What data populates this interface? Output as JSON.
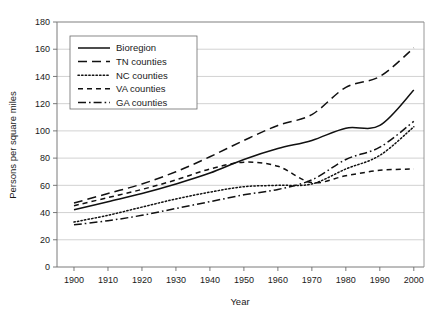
{
  "chart_data": {
    "type": "line",
    "title": "",
    "xlabel": "Year",
    "ylabel": "Persons per square miles",
    "xlim": [
      1895,
      2003
    ],
    "ylim": [
      0,
      180
    ],
    "xticks": [
      1900,
      1910,
      1920,
      1930,
      1940,
      1950,
      1960,
      1970,
      1980,
      1990,
      2000
    ],
    "yticks": [
      0,
      20,
      40,
      60,
      80,
      100,
      120,
      140,
      160,
      180
    ],
    "grid": "horizontal",
    "legend_position": "top-left-inside",
    "x": [
      1900,
      1910,
      1920,
      1930,
      1940,
      1950,
      1960,
      1970,
      1980,
      1990,
      2000
    ],
    "series": [
      {
        "name": "Bioregion",
        "style": "solid",
        "values": [
          42,
          48,
          54,
          61,
          69,
          79,
          87,
          93,
          102,
          104,
          130
        ]
      },
      {
        "name": "TN counties",
        "style": "long-dash",
        "values": [
          47,
          54,
          61,
          70,
          81,
          93,
          104,
          112,
          132,
          140,
          161
        ]
      },
      {
        "name": "NC counties",
        "style": "dotted",
        "values": [
          33,
          38,
          44,
          50,
          55,
          59,
          60,
          61,
          72,
          82,
          103
        ]
      },
      {
        "name": "VA counties",
        "style": "dashed",
        "values": [
          45,
          51,
          57,
          64,
          72,
          77,
          74,
          62,
          67,
          71,
          72
        ]
      },
      {
        "name": "GA counties",
        "style": "dash-dot",
        "values": [
          31,
          34,
          38,
          43,
          48,
          53,
          57,
          64,
          79,
          88,
          107
        ]
      }
    ]
  },
  "axes": {
    "y_title": "Persons per square miles",
    "x_title": "Year",
    "y_tick_labels": [
      "0",
      "20",
      "40",
      "60",
      "80",
      "100",
      "120",
      "140",
      "160",
      "180"
    ],
    "x_tick_labels": [
      "1900",
      "1910",
      "1920",
      "1930",
      "1940",
      "1950",
      "1960",
      "1970",
      "1980",
      "1990",
      "2000"
    ]
  },
  "legend": {
    "items": [
      {
        "label": "Bioregion",
        "style": "solid"
      },
      {
        "label": "TN counties",
        "style": "long-dash"
      },
      {
        "label": "NC counties",
        "style": "dotted"
      },
      {
        "label": "VA counties",
        "style": "dashed"
      },
      {
        "label": "GA counties",
        "style": "dash-dot"
      }
    ]
  },
  "colors": {
    "line": "#111111",
    "grid": "#bfbfbf",
    "axis": "#6b6b6b",
    "background": "#ffffff"
  }
}
